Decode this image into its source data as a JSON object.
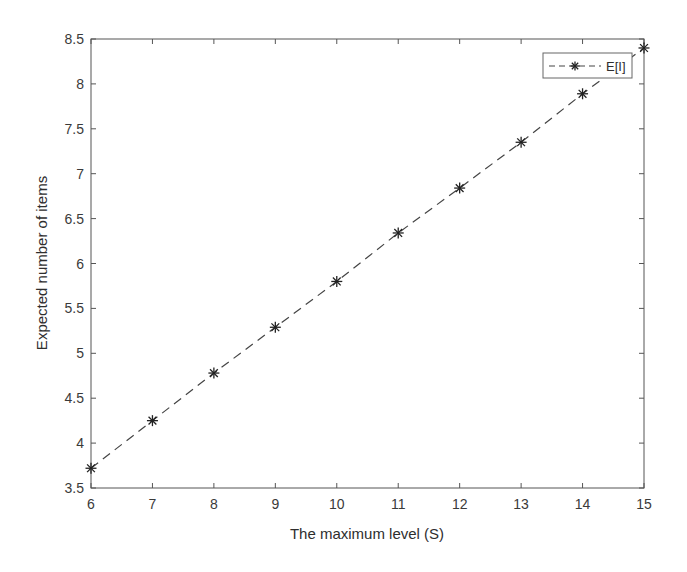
{
  "chart_data": {
    "type": "line",
    "title": "",
    "xlabel": "The maximum level (S)",
    "ylabel": "Expected number of items",
    "x": [
      6,
      7,
      8,
      9,
      10,
      11,
      12,
      13,
      14,
      15
    ],
    "series": [
      {
        "name": "E[I]",
        "values": [
          3.72,
          4.25,
          4.78,
          5.29,
          5.8,
          6.34,
          6.84,
          7.35,
          7.89,
          8.4
        ],
        "line_style": "dashed",
        "marker": "asterisk",
        "color": "#333333"
      }
    ],
    "xlim": [
      6,
      15
    ],
    "ylim": [
      3.5,
      8.5
    ],
    "xticks": [
      "6",
      "7",
      "8",
      "9",
      "10",
      "11",
      "12",
      "13",
      "14",
      "15"
    ],
    "yticks": [
      "3.5",
      "4",
      "4.5",
      "5",
      "5.5",
      "6",
      "6.5",
      "7",
      "7.5",
      "8",
      "8.5"
    ],
    "grid": false,
    "legend_position": "upper right"
  }
}
